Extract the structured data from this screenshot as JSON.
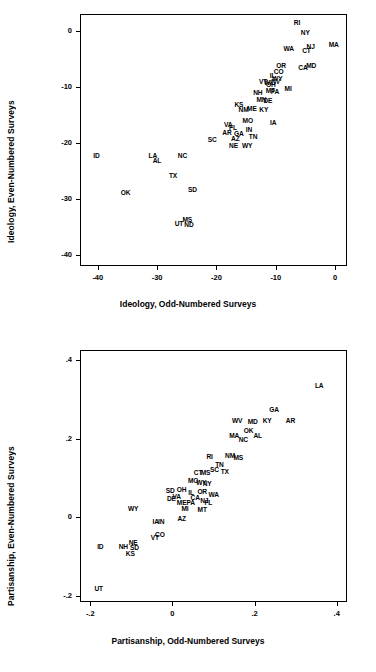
{
  "figure": {
    "panels": [
      {
        "id": "ideology",
        "chart_data": {
          "type": "scatter",
          "title": "",
          "xlabel": "Ideology, Odd-Numbered Surveys",
          "ylabel": "Ideology, Even-Numbered Surveys",
          "xlim": [
            -43,
            2
          ],
          "ylim": [
            -42,
            3
          ],
          "xticks": [
            "-40",
            "-30",
            "-20",
            "-10",
            "0"
          ],
          "xtickvals": [
            -40,
            -30,
            -20,
            -10,
            0
          ],
          "yticks": [
            "0",
            "-10",
            "-20",
            "-30",
            "-40"
          ],
          "ytickvals": [
            0,
            -10,
            -20,
            -30,
            -40
          ],
          "grid": false,
          "legend": "none",
          "point_label_mode": "state-abbreviation",
          "points": [
            {
              "label": "RI",
              "x": -6.6,
              "y": 1.6
            },
            {
              "label": "MA",
              "x": -0.4,
              "y": -2.3
            },
            {
              "label": "NY",
              "x": -5.2,
              "y": -0.2
            },
            {
              "label": "WA",
              "x": -8.0,
              "y": -3.0
            },
            {
              "label": "NJ",
              "x": -4.3,
              "y": -2.7
            },
            {
              "label": "CT",
              "x": -5.0,
              "y": -3.4
            },
            {
              "label": "MD",
              "x": -4.2,
              "y": -6.1
            },
            {
              "label": "CA",
              "x": -5.6,
              "y": -6.4
            },
            {
              "label": "OR",
              "x": -9.3,
              "y": -6.1
            },
            {
              "label": "CO",
              "x": -9.7,
              "y": -7.2
            },
            {
              "label": "IL",
              "x": -10.7,
              "y": -7.9
            },
            {
              "label": "WY2",
              "x": -9.9,
              "y": -8.4
            },
            {
              "label": "NV",
              "x": -10.2,
              "y": -9.0
            },
            {
              "label": "VT",
              "x": -12.3,
              "y": -8.9
            },
            {
              "label": "OH",
              "x": -11.0,
              "y": -9.5
            },
            {
              "label": "WI",
              "x": -11.5,
              "y": -9.2
            },
            {
              "label": "MI",
              "x": -8.1,
              "y": -10.2
            },
            {
              "label": "MT",
              "x": -11.1,
              "y": -10.6
            },
            {
              "label": "PA",
              "x": -10.3,
              "y": -10.8
            },
            {
              "label": "NH",
              "x": -13.2,
              "y": -11.0
            },
            {
              "label": "MN",
              "x": -12.6,
              "y": -12.1
            },
            {
              "label": "DE",
              "x": -11.5,
              "y": -12.4
            },
            {
              "label": "KS",
              "x": -16.4,
              "y": -13.1
            },
            {
              "label": "ME",
              "x": -14.2,
              "y": -13.8
            },
            {
              "label": "NM",
              "x": -15.6,
              "y": -13.9
            },
            {
              "label": "KY",
              "x": -12.2,
              "y": -14.0
            },
            {
              "label": "IA",
              "x": -10.6,
              "y": -16.2
            },
            {
              "label": "MO",
              "x": -14.9,
              "y": -16.0
            },
            {
              "label": "VA",
              "x": -18.2,
              "y": -16.6
            },
            {
              "label": "FL",
              "x": -17.4,
              "y": -17.2
            },
            {
              "label": "IN",
              "x": -14.7,
              "y": -17.5
            },
            {
              "label": "AR",
              "x": -18.4,
              "y": -18.1
            },
            {
              "label": "GA",
              "x": -16.4,
              "y": -18.2
            },
            {
              "label": "TN",
              "x": -14.0,
              "y": -18.8
            },
            {
              "label": "AZ",
              "x": -17.0,
              "y": -19.2
            },
            {
              "label": "SC",
              "x": -20.9,
              "y": -19.4
            },
            {
              "label": "NE",
              "x": -17.3,
              "y": -20.4
            },
            {
              "label": "WY",
              "x": -15.0,
              "y": -20.4
            },
            {
              "label": "ID",
              "x": -40.4,
              "y": -22.1
            },
            {
              "label": "LA",
              "x": -30.9,
              "y": -22.2
            },
            {
              "label": "AL",
              "x": -30.2,
              "y": -23.0
            },
            {
              "label": "NC",
              "x": -25.9,
              "y": -22.2
            },
            {
              "label": "TX",
              "x": -27.5,
              "y": -25.8
            },
            {
              "label": "SD",
              "x": -24.2,
              "y": -28.2
            },
            {
              "label": "OK",
              "x": -35.5,
              "y": -28.8
            },
            {
              "label": "UT",
              "x": -26.5,
              "y": -34.4
            },
            {
              "label": "MS",
              "x": -25.1,
              "y": -33.6
            },
            {
              "label": "ND",
              "x": -24.8,
              "y": -34.5
            }
          ]
        }
      },
      {
        "id": "partisanship",
        "chart_data": {
          "type": "scatter",
          "title": "",
          "xlabel": "Partisanship, Odd-Numbered Surveys",
          "ylabel": "Partisanship, Even-Numbered Surveys",
          "xlim": [
            -0.225,
            0.425
          ],
          "ylim": [
            -0.215,
            0.425
          ],
          "xticks": [
            "-.2",
            "0",
            ".2",
            ".4"
          ],
          "xtickvals": [
            -0.2,
            0,
            0.2,
            0.4
          ],
          "yticks": [
            ".4",
            ".2",
            "0",
            "-.2"
          ],
          "ytickvals": [
            0.4,
            0.2,
            0,
            -0.2
          ],
          "grid": false,
          "legend": "none",
          "point_label_mode": "state-abbreviation",
          "points": [
            {
              "label": "LA",
              "x": 0.355,
              "y": 0.335
            },
            {
              "label": "GA",
              "x": 0.245,
              "y": 0.275
            },
            {
              "label": "AR",
              "x": 0.285,
              "y": 0.248
            },
            {
              "label": "KY",
              "x": 0.228,
              "y": 0.248
            },
            {
              "label": "MD",
              "x": 0.193,
              "y": 0.245
            },
            {
              "label": "WV",
              "x": 0.155,
              "y": 0.248
            },
            {
              "label": "OK",
              "x": 0.183,
              "y": 0.223
            },
            {
              "label": "AL",
              "x": 0.205,
              "y": 0.21
            },
            {
              "label": "MA",
              "x": 0.148,
              "y": 0.208
            },
            {
              "label": "NC",
              "x": 0.17,
              "y": 0.2
            },
            {
              "label": "NM",
              "x": 0.138,
              "y": 0.158
            },
            {
              "label": "MS",
              "x": 0.158,
              "y": 0.152
            },
            {
              "label": "RI",
              "x": 0.088,
              "y": 0.157
            },
            {
              "label": "TN",
              "x": 0.112,
              "y": 0.135
            },
            {
              "label": "SC",
              "x": 0.1,
              "y": 0.123
            },
            {
              "label": "TX",
              "x": 0.125,
              "y": 0.118
            },
            {
              "label": "MS2",
              "x": 0.078,
              "y": 0.115
            },
            {
              "label": "CT",
              "x": 0.06,
              "y": 0.115
            },
            {
              "label": "MO",
              "x": 0.048,
              "y": 0.095
            },
            {
              "label": "WY3",
              "x": 0.068,
              "y": 0.09
            },
            {
              "label": "NY",
              "x": 0.082,
              "y": 0.088
            },
            {
              "label": "OH",
              "x": 0.02,
              "y": 0.072
            },
            {
              "label": "IL",
              "x": 0.043,
              "y": 0.065
            },
            {
              "label": "OR",
              "x": 0.07,
              "y": 0.068
            },
            {
              "label": "SD",
              "x": -0.008,
              "y": 0.07
            },
            {
              "label": "WA",
              "x": 0.098,
              "y": 0.06
            },
            {
              "label": "VA",
              "x": 0.008,
              "y": 0.055
            },
            {
              "label": "DE",
              "x": -0.005,
              "y": 0.048
            },
            {
              "label": "CA",
              "x": 0.053,
              "y": 0.052
            },
            {
              "label": "NJ",
              "x": 0.075,
              "y": 0.045
            },
            {
              "label": "ME",
              "x": 0.02,
              "y": 0.04
            },
            {
              "label": "PA",
              "x": 0.042,
              "y": 0.038
            },
            {
              "label": "FL",
              "x": 0.085,
              "y": 0.04
            },
            {
              "label": "MI",
              "x": 0.028,
              "y": 0.025
            },
            {
              "label": "MT",
              "x": 0.07,
              "y": 0.022
            },
            {
              "label": "WY",
              "x": -0.098,
              "y": 0.025
            },
            {
              "label": "AZ",
              "x": 0.02,
              "y": -0.002
            },
            {
              "label": "IA",
              "x": -0.043,
              "y": -0.01
            },
            {
              "label": "IN",
              "x": -0.03,
              "y": -0.01
            },
            {
              "label": "CO",
              "x": -0.033,
              "y": -0.042
            },
            {
              "label": "VT",
              "x": -0.045,
              "y": -0.05
            },
            {
              "label": "NE",
              "x": -0.098,
              "y": -0.062
            },
            {
              "label": "NH",
              "x": -0.122,
              "y": -0.073
            },
            {
              "label": "SD2",
              "x": -0.095,
              "y": -0.075
            },
            {
              "label": "ID",
              "x": -0.178,
              "y": -0.072
            },
            {
              "label": "KS",
              "x": -0.105,
              "y": -0.09
            },
            {
              "label": "UT",
              "x": -0.182,
              "y": -0.18
            }
          ]
        }
      }
    ]
  }
}
